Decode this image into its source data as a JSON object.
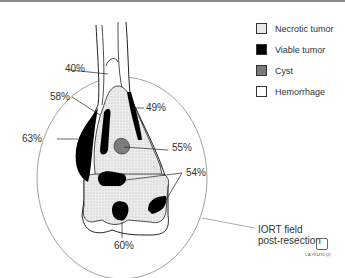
{
  "legend": {
    "items": [
      {
        "label": "Necrotic tumor",
        "pattern": "light-stipple",
        "color": "#e6e6e6"
      },
      {
        "label": "Viable tumor",
        "pattern": "solid",
        "color": "#000000"
      },
      {
        "label": "Cyst",
        "pattern": "dark-stipple",
        "color": "#7a7a7a"
      },
      {
        "label": "Hemorrhage",
        "pattern": "blank",
        "color": "#ffffff"
      }
    ]
  },
  "labels": {
    "p40": "40%",
    "p58": "58%",
    "p49": "49%",
    "p63": "63%",
    "p55": "55%",
    "p54": "54%",
    "p60": "60%"
  },
  "field": {
    "line1": "IORT field",
    "line2": "post-resection"
  },
  "footer": {
    "code": "CA 791470 (2)"
  }
}
